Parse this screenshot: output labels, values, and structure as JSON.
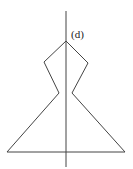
{
  "figure": {
    "label": "(d)",
    "stroke_color": "#444444",
    "axis": {
      "x": 66,
      "y1": 11,
      "y2": 167
    },
    "shape_points": [
      [
        66,
        41
      ],
      [
        88,
        63
      ],
      [
        72,
        93
      ],
      [
        125,
        152
      ],
      [
        7,
        152
      ],
      [
        59,
        93
      ],
      [
        44,
        62
      ]
    ]
  }
}
